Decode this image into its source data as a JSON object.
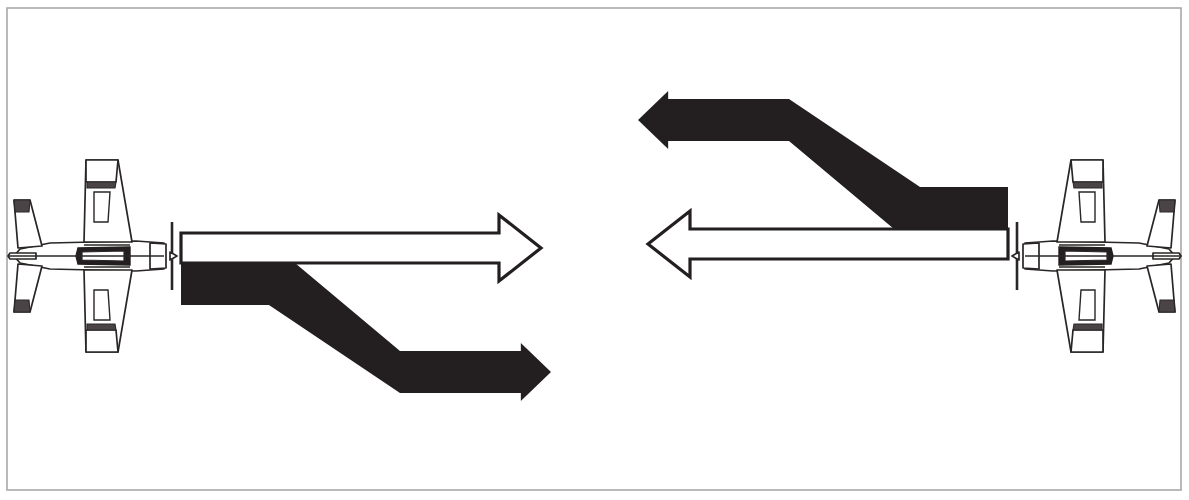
{
  "figure": {
    "width": 1189,
    "height": 500,
    "background_color": "#ffffff"
  },
  "frame": {
    "name": "outer border rectangle",
    "x": 7,
    "y": 8,
    "width": 1174,
    "height": 482,
    "stroke_color": "#a8a8a8",
    "stroke_width": 1.6,
    "fill": "none"
  },
  "colors": {
    "ink": "#231f20",
    "solid_arrow_fill": "#231f20",
    "open_arrow_fill": "#ffffff",
    "open_arrow_stroke": "#231f20",
    "aircraft_line": "#2a2626",
    "aircraft_fill": "#ffffff",
    "aircraft_accent": "#3a3436",
    "border": "#a8a8a8",
    "page": "#ffffff"
  },
  "groups": [
    {
      "id": "left",
      "name": "left-aircraft-group",
      "label": "Left aircraft with forward white arrow and descending black offset arrow",
      "heading": "east",
      "aircraft": {
        "name": "aircraft-top-view-left",
        "facing": "right",
        "nose_x": 170,
        "center_y": 256,
        "span_top_y": 160,
        "span_bottom_y": 352,
        "tail_x": 14
      },
      "open_arrow": {
        "name": "open-flight-path-arrow",
        "style": "outline",
        "direction": "right",
        "shaft_x": 181,
        "shaft_y": 233,
        "shaft_w": 318,
        "shaft_h": 30,
        "head_tip_x": 541,
        "head_top_y": 215,
        "head_bottom_y": 281
      },
      "solid_arrow": {
        "name": "solid-offset-path-arrow",
        "style": "filled",
        "direction": "right-then-down-right",
        "band_thickness": 42,
        "start_x": 181,
        "upper_band_y": 263,
        "dogleg_start_x": 295,
        "dogleg_end_x": 400,
        "lower_band_y": 351,
        "head_tip_x": 551,
        "head_top_y": 343,
        "head_bottom_y": 401
      }
    },
    {
      "id": "right",
      "name": "right-aircraft-group",
      "label": "Right aircraft with forward white arrow and climbing black offset arrow",
      "heading": "west",
      "aircraft": {
        "name": "aircraft-top-view-right",
        "facing": "left",
        "nose_x": 1019,
        "center_y": 256,
        "span_top_y": 160,
        "span_bottom_y": 352,
        "tail_x": 1175
      },
      "open_arrow": {
        "name": "open-flight-path-arrow",
        "style": "outline",
        "direction": "left",
        "shaft_x": 690,
        "shaft_y": 229,
        "shaft_w": 318,
        "shaft_h": 30,
        "head_tip_x": 648,
        "head_top_y": 211,
        "head_bottom_y": 277
      },
      "solid_arrow": {
        "name": "solid-offset-path-arrow",
        "style": "filled",
        "direction": "left-then-up-left",
        "band_thickness": 42,
        "start_x": 1008,
        "lower_band_y": 187,
        "dogleg_start_x": 894,
        "dogleg_end_x": 789,
        "upper_band_y": 99,
        "head_tip_x": 638,
        "head_top_y": 91,
        "head_bottom_y": 149
      }
    }
  ],
  "annotations": {
    "open_arrow_meaning": "intended / continuing straight flight path",
    "solid_arrow_meaning": "offset or diverging flight path",
    "symmetry": "180 degree rotational (point) symmetry about the figure centre"
  }
}
